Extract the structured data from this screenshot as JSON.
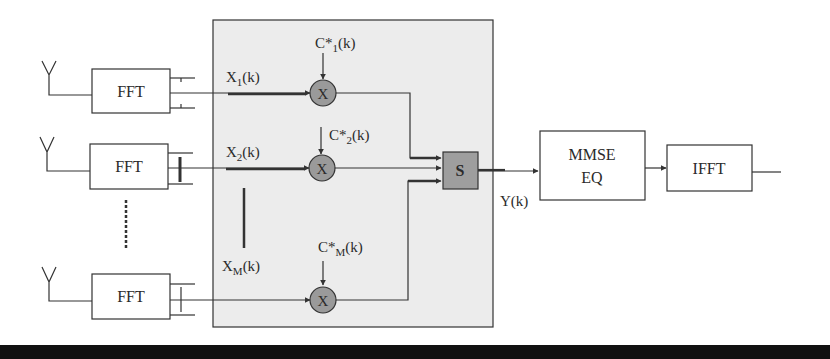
{
  "diagram": {
    "type": "block-diagram",
    "colors": {
      "stroke": "#333333",
      "combiner_background": "#ececec",
      "multiplier_fill": "#9a9a9a",
      "sum_fill": "#9e9e9e",
      "bottom_bar": "#111111"
    },
    "branches": [
      {
        "fft_label": "FFT",
        "input_label": "X",
        "input_sub": "1",
        "input_suffix": "(k)",
        "weight_label": "C*",
        "weight_sub": "1",
        "weight_suffix": "(k)",
        "multiplier_label": "X"
      },
      {
        "fft_label": "FFT",
        "input_label": "X",
        "input_sub": "2",
        "input_suffix": "(k)",
        "weight_label": "C*",
        "weight_sub": "2",
        "weight_suffix": "(k)",
        "multiplier_label": "X"
      },
      {
        "fft_label": "FFT",
        "input_label": "X",
        "input_sub": "M",
        "input_suffix": "(k)",
        "weight_label": "C*",
        "weight_sub": "M",
        "weight_suffix": "(k)",
        "multiplier_label": "X"
      }
    ],
    "sum_block": {
      "label": "S"
    },
    "output_signal": {
      "label": "Y(k)"
    },
    "equalizer": {
      "line1": "MMSE",
      "line2": "EQ"
    },
    "ifft": {
      "label": "IFFT"
    }
  }
}
